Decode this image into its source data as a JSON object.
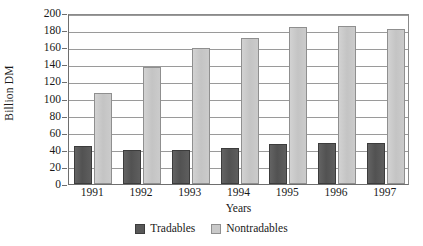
{
  "chart_data": {
    "type": "bar",
    "title": "",
    "xlabel": "Years",
    "ylabel": "Billion DM",
    "categories": [
      "1991",
      "1992",
      "1993",
      "1994",
      "1995",
      "1996",
      "1997"
    ],
    "series": [
      {
        "name": "Tradables",
        "color": "#585858",
        "values": [
          44,
          40,
          40,
          42,
          47,
          48,
          48
        ]
      },
      {
        "name": "Nontradables",
        "color": "#c9c9c9",
        "values": [
          106,
          137,
          159,
          171,
          184,
          185,
          181
        ]
      }
    ],
    "ylim": [
      0,
      200
    ],
    "ytick_step": 20,
    "yticks": [
      0,
      20,
      40,
      60,
      80,
      100,
      120,
      140,
      160,
      180,
      200
    ],
    "ytick_labels": [
      "0",
      "20",
      "40",
      "60",
      "80",
      "100",
      "120",
      "140",
      "160",
      "180",
      "200"
    ],
    "grid": "horizontal",
    "legend_position": "bottom-center"
  },
  "legend": {
    "entries": [
      {
        "label": "Tradables",
        "swatch": "tradables-swatch-icon"
      },
      {
        "label": "Nontradables",
        "swatch": "nontradables-swatch-icon"
      }
    ]
  }
}
